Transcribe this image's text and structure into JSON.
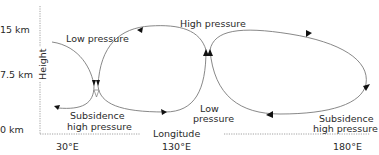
{
  "diagram": {
    "y_axis": {
      "label": "Height",
      "ticks": [
        "15 km",
        "7.5 km",
        "0 km"
      ]
    },
    "x_axis": {
      "label": "Longitude",
      "ticks": [
        "30°E",
        "130°E",
        "180°E"
      ]
    },
    "labels": {
      "low_pressure_upper_left": "Low pressure",
      "high_pressure_upper_center": "High pressure",
      "subsidence_left_1": "Subsidence",
      "subsidence_left_2": "high pressure",
      "low_pressure_surface_1": "Low",
      "low_pressure_surface_2": "pressure",
      "subsidence_right_1": "Subsidence",
      "subsidence_right_2": "high pressure"
    },
    "colors": {
      "flow_line": "#7a7a7a",
      "arrowhead": "#111111",
      "text": "#2a2a2a",
      "axis": "#8a8a8a"
    }
  }
}
